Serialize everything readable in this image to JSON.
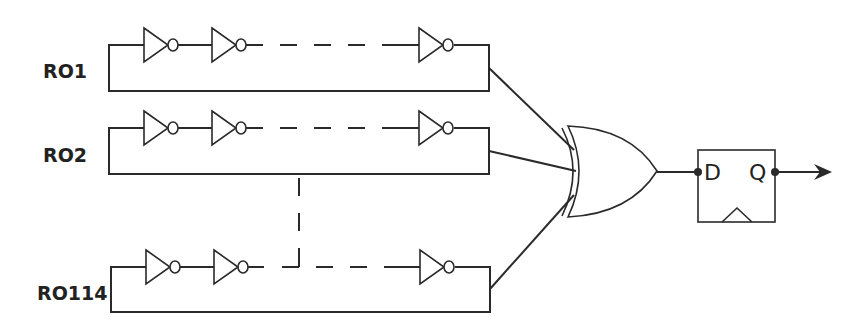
{
  "diagram": {
    "type": "ring-oscillator-trng",
    "oscillators": [
      {
        "label": "RO1",
        "top_y": 45,
        "bottom_y": 91,
        "left_x": 109
      },
      {
        "label": "RO2",
        "top_y": 128,
        "bottom_y": 174,
        "left_x": 109
      },
      {
        "label": "RO114",
        "top_y": 267,
        "bottom_y": 312,
        "left_x": 111
      }
    ],
    "xor_gate": {
      "label": "XOR"
    },
    "flip_flop": {
      "d_label": "D",
      "q_label": "Q"
    },
    "colors": {
      "stroke": "#2a2a2a",
      "background": "#ffffff",
      "text": "#222222"
    }
  }
}
